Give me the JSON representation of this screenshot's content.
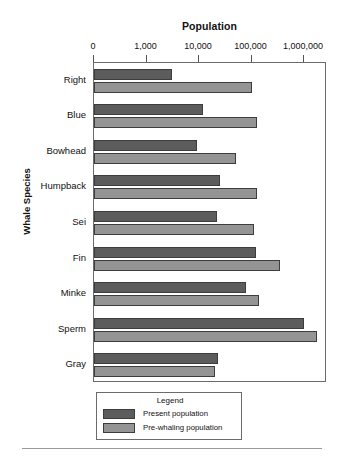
{
  "chart_data": {
    "type": "bar",
    "orientation": "horizontal",
    "title": "Population",
    "xlabel": "Population",
    "ylabel": "Whale Species",
    "xscale": "log",
    "grid": false,
    "legend_position": "below-plot",
    "legend_title": "Legend",
    "xticks": [
      {
        "label": "0",
        "value": 0
      },
      {
        "label": "1,000",
        "value": 1000
      },
      {
        "label": "10,000",
        "value": 10000
      },
      {
        "label": "100,000",
        "value": 100000
      },
      {
        "label": "1,000,000",
        "value": 1000000
      }
    ],
    "categories": [
      "Right",
      "Blue",
      "Bowhead",
      "Humpback",
      "Sei",
      "Fin",
      "Minke",
      "Sperm",
      "Gray"
    ],
    "series": [
      {
        "name": "Present population",
        "color": "#5c5c5c",
        "values": [
          3000,
          12000,
          9000,
          25000,
          22000,
          120000,
          80000,
          1000000,
          23000
        ]
      },
      {
        "name": "Pre-whaling population",
        "color": "#949494",
        "values": [
          100000,
          130000,
          50000,
          130000,
          110000,
          350000,
          140000,
          1800000,
          20000
        ]
      }
    ]
  },
  "chart": {
    "title": "Population",
    "y_axis_title": "Whale Species",
    "x_tick_labels": [
      "0",
      "1,000",
      "10,000",
      "100,000",
      "1,000,000"
    ],
    "category_labels": [
      "Right",
      "Blue",
      "Bowhead",
      "Humpback",
      "Sei",
      "Fin",
      "Minke",
      "Sperm",
      "Gray"
    ]
  },
  "legend": {
    "title": "Legend",
    "items": [
      {
        "label": "Present population",
        "color": "#5c5c5c"
      },
      {
        "label": "Pre-whaling population",
        "color": "#949494"
      }
    ]
  }
}
